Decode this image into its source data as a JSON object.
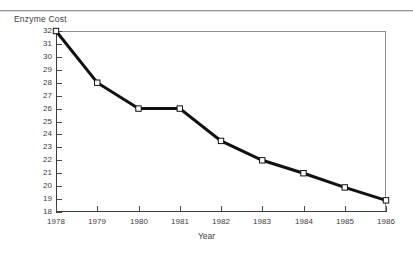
{
  "figure": {
    "ylabel": "Enzyme Cost",
    "xlabel": "Year"
  },
  "chart_data": {
    "type": "line",
    "title": "",
    "ylabel": "Enzyme Cost",
    "xlabel": "Year",
    "categories": [
      "1978",
      "1979",
      "1980",
      "1981",
      "1982",
      "1983",
      "1984",
      "1985",
      "1986"
    ],
    "values": [
      32,
      28,
      26,
      26,
      23.5,
      22,
      21,
      19.9,
      18.9
    ],
    "xlim": [
      1978,
      1986
    ],
    "ylim": [
      18,
      32
    ],
    "ytick_labels": [
      "32",
      "31",
      "30",
      "29",
      "28",
      "27",
      "26",
      "25",
      "24",
      "23",
      "22",
      "21",
      "20",
      "19",
      "18"
    ],
    "ytick_values": [
      32,
      31,
      30,
      29,
      28,
      27,
      26,
      25,
      24,
      23,
      22,
      21,
      20,
      19,
      18
    ],
    "xtick_labels": [
      "1978",
      "1979",
      "1980",
      "1981",
      "1982",
      "1983",
      "1984",
      "1985",
      "1986"
    ],
    "grid": false,
    "legend": null,
    "marker": "open-square",
    "line_color": "#111111",
    "marker_face_color": "#ffffff",
    "marker_edge_color": "#111111",
    "line_width": 3
  }
}
